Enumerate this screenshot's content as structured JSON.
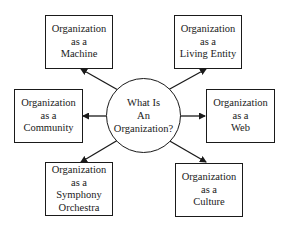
{
  "center": {
    "lines": [
      "What Is",
      "An",
      "Organization?"
    ]
  },
  "nodes": [
    {
      "id": "machine",
      "lines": [
        "Organization",
        "as a",
        "Machine"
      ]
    },
    {
      "id": "living-entity",
      "lines": [
        "Organization",
        "as a",
        "Living Entity"
      ]
    },
    {
      "id": "community",
      "lines": [
        "Organization",
        "as a",
        "Community"
      ]
    },
    {
      "id": "web",
      "lines": [
        "Organization",
        "as a",
        "Web"
      ]
    },
    {
      "id": "symphony-orchestra",
      "lines": [
        "Organization",
        "as a",
        "Symphony",
        "Orchestra"
      ]
    },
    {
      "id": "culture",
      "lines": [
        "Organization",
        "as a",
        "Culture"
      ]
    }
  ],
  "edges": [
    {
      "from": "center",
      "to": "machine"
    },
    {
      "from": "center",
      "to": "living-entity"
    },
    {
      "from": "center",
      "to": "community"
    },
    {
      "from": "center",
      "to": "web"
    },
    {
      "from": "center",
      "to": "symphony-orchestra"
    },
    {
      "from": "center",
      "to": "culture"
    }
  ]
}
